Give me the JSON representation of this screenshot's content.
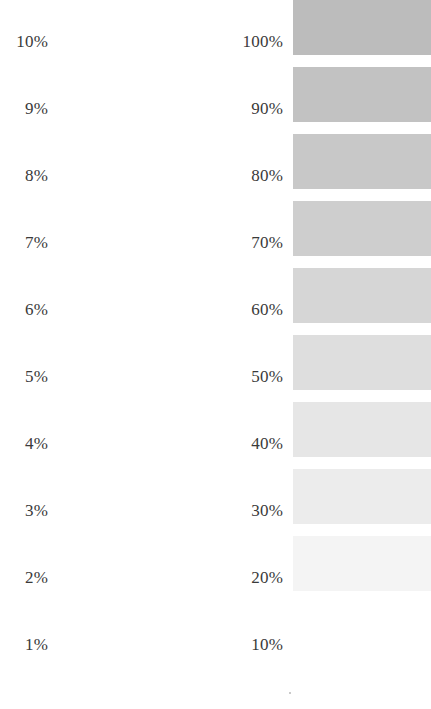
{
  "chart_data": {
    "type": "table",
    "xlabel": "",
    "ylabel": "",
    "grid": false,
    "legend": "none",
    "columns": [
      "units_percent",
      "tens_percent",
      "tone_swatch"
    ],
    "rows": [
      {
        "units_label": "10%",
        "tens_label": "100%",
        "tone_value": 100,
        "swatch_color": "#bcbcbc"
      },
      {
        "units_label": "9%",
        "tens_label": "90%",
        "tone_value": 90,
        "swatch_color": "#c2c2c2"
      },
      {
        "units_label": "8%",
        "tens_label": "80%",
        "tone_value": 80,
        "swatch_color": "#c8c8c8"
      },
      {
        "units_label": "7%",
        "tens_label": "70%",
        "tone_value": 70,
        "swatch_color": "#cecece"
      },
      {
        "units_label": "6%",
        "tens_label": "60%",
        "tone_value": 60,
        "swatch_color": "#d6d6d6"
      },
      {
        "units_label": "5%",
        "tens_label": "50%",
        "tone_value": 50,
        "swatch_color": "#dedede"
      },
      {
        "units_label": "4%",
        "tens_label": "40%",
        "tone_value": 40,
        "swatch_color": "#e6e6e6"
      },
      {
        "units_label": "3%",
        "tens_label": "30%",
        "tone_value": 30,
        "swatch_color": "#ececec"
      },
      {
        "units_label": "2%",
        "tens_label": "20%",
        "tone_value": 20,
        "swatch_color": "#f4f4f4"
      },
      {
        "units_label": "1%",
        "tens_label": "10%",
        "tone_value": 10,
        "swatch_color": "#ffffff"
      }
    ],
    "text_color": "#3a3a3a",
    "background_color": "#ffffff"
  }
}
